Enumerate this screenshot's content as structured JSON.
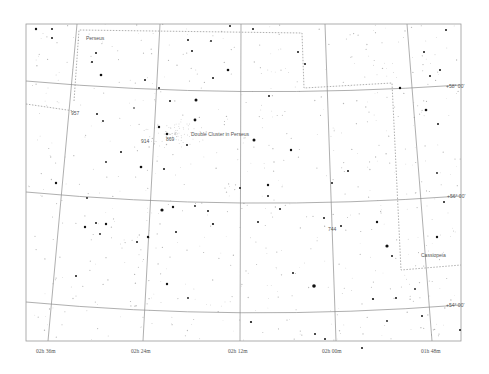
{
  "map": {
    "frame": {
      "x": 26,
      "y": 24,
      "width": 435,
      "height": 317
    },
    "colors": {
      "background": "#ffffff",
      "grid": "#8c8c8c",
      "star": "#111111",
      "label": "#555555"
    },
    "ra_labels": [
      {
        "text": "02h 36m",
        "x": 36,
        "y": 353
      },
      {
        "text": "02h 24m",
        "x": 131,
        "y": 353
      },
      {
        "text": "02h 12m",
        "x": 228,
        "y": 353
      },
      {
        "text": "02h 00m",
        "x": 322,
        "y": 353
      },
      {
        "text": "01h 48m",
        "x": 421,
        "y": 353
      }
    ],
    "dec_labels": [
      {
        "text": "+58° 00'",
        "x": 446,
        "y": 88
      },
      {
        "text": "+56° 00'",
        "x": 447,
        "y": 198
      },
      {
        "text": "+54° 00'",
        "x": 446,
        "y": 307
      }
    ],
    "constellation_labels": [
      {
        "text": "Perseus",
        "x": 86,
        "y": 40
      },
      {
        "text": "Cassiopeia",
        "x": 421,
        "y": 257
      }
    ],
    "object_labels": [
      {
        "text": "Double Cluster in Perseus",
        "x": 191,
        "y": 136
      },
      {
        "text": "957",
        "x": 71,
        "y": 115
      },
      {
        "text": "914",
        "x": 141,
        "y": 143
      },
      {
        "text": "869",
        "x": 166,
        "y": 141
      },
      {
        "text": "744",
        "x": 328,
        "y": 231
      }
    ],
    "grid_lines": [
      {
        "name": "dec-58",
        "d": "M26,81 Q240,100 461,85"
      },
      {
        "name": "dec-56",
        "d": "M26,192 Q240,212 461,196"
      },
      {
        "name": "dec-54",
        "d": "M26,302 Q240,322 461,305"
      },
      {
        "name": "ra-0236",
        "d": "M77,24 L48,341"
      },
      {
        "name": "ra-0224",
        "d": "M160,24 L143,341"
      },
      {
        "name": "ra-0212",
        "d": "M241,24 L240,341"
      },
      {
        "name": "ra-0200",
        "d": "M325,24 L336,341"
      },
      {
        "name": "ra-0148",
        "d": "M407,24 L432,341"
      }
    ],
    "boundaries": [
      {
        "name": "perseus-boundary-top",
        "d": "M74,101 L79,30 L302,33 L304,88 L392,83 L401,270 L461,265"
      },
      {
        "name": "perseus-boundary-left",
        "d": "M26,104 L74,111"
      }
    ],
    "bright_stars": [
      [
        36,
        29,
        1.2
      ],
      [
        52,
        29,
        1.0
      ],
      [
        52,
        38,
        1.0
      ],
      [
        101,
        75,
        1.3
      ],
      [
        196,
        100,
        1.5
      ],
      [
        195,
        120,
        1.4
      ],
      [
        97,
        114,
        1.0
      ],
      [
        159,
        127,
        1.2
      ],
      [
        167,
        134,
        1.3
      ],
      [
        187,
        145,
        1.0
      ],
      [
        141,
        167,
        1.3
      ],
      [
        164,
        169,
        1.0
      ],
      [
        103,
        121,
        0.9
      ],
      [
        134,
        108,
        0.8
      ],
      [
        56,
        183,
        1.2
      ],
      [
        162,
        210,
        1.6
      ],
      [
        173,
        207,
        1.2
      ],
      [
        208,
        211,
        1.0
      ],
      [
        85,
        227,
        1.2
      ],
      [
        96,
        223,
        1.0
      ],
      [
        106,
        224,
        1.2
      ],
      [
        100,
        234,
        0.9
      ],
      [
        148,
        237,
        1.2
      ],
      [
        137,
        242,
        1.0
      ],
      [
        76,
        276,
        1.0
      ],
      [
        167,
        284,
        1.2
      ],
      [
        188,
        298,
        0.9
      ],
      [
        213,
        224,
        1.1
      ],
      [
        254,
        140,
        1.5
      ],
      [
        291,
        150,
        1.2
      ],
      [
        268,
        185,
        1.2
      ],
      [
        258,
        222,
        1.0
      ],
      [
        280,
        209,
        1.0
      ],
      [
        314,
        286,
        1.8
      ],
      [
        293,
        273,
        1.0
      ],
      [
        324,
        218,
        1.0
      ],
      [
        341,
        226,
        1.0
      ],
      [
        377,
        222,
        1.2
      ],
      [
        387,
        246,
        1.6
      ],
      [
        392,
        256,
        1.0
      ],
      [
        373,
        299,
        1.1
      ],
      [
        396,
        298,
        1.0
      ],
      [
        415,
        289,
        0.9
      ],
      [
        251,
        322,
        1.1
      ],
      [
        315,
        334,
        1.0
      ],
      [
        325,
        339,
        1.0
      ],
      [
        362,
        348,
        1.0
      ],
      [
        253,
        29,
        1.0
      ],
      [
        332,
        183,
        1.0
      ],
      [
        348,
        171,
        1.0
      ],
      [
        400,
        88,
        1.2
      ],
      [
        426,
        110,
        1.3
      ],
      [
        438,
        124,
        1.0
      ],
      [
        437,
        237,
        1.2
      ],
      [
        444,
        202,
        1.0
      ],
      [
        437,
        173,
        0.9
      ],
      [
        228,
        70,
        1.3
      ],
      [
        230,
        26,
        1.0
      ],
      [
        213,
        78,
        1.0
      ],
      [
        188,
        40,
        1.0
      ],
      [
        192,
        51,
        1.0
      ],
      [
        211,
        41,
        0.9
      ],
      [
        96,
        53,
        1.0
      ],
      [
        92,
        62,
        1.0
      ],
      [
        145,
        80,
        1.0
      ],
      [
        159,
        88,
        1.0
      ],
      [
        170,
        101,
        1.0
      ],
      [
        269,
        96,
        1.0
      ],
      [
        298,
        52,
        1.0
      ],
      [
        305,
        64,
        1.0
      ],
      [
        424,
        52,
        1.0
      ],
      [
        440,
        70,
        1.0
      ],
      [
        446,
        30,
        1.0
      ],
      [
        430,
        76,
        1.0
      ],
      [
        460,
        330,
        1.0
      ],
      [
        422,
        316,
        1.0
      ],
      [
        387,
        321,
        0.9
      ],
      [
        268,
        196,
        1.0
      ],
      [
        240,
        188,
        1.0
      ],
      [
        121,
        152,
        1.0
      ],
      [
        106,
        162,
        0.9
      ],
      [
        87,
        198,
        0.9
      ],
      [
        176,
        232,
        1.0
      ],
      [
        195,
        206,
        0.9
      ]
    ],
    "faint_star_seed": 37
  }
}
